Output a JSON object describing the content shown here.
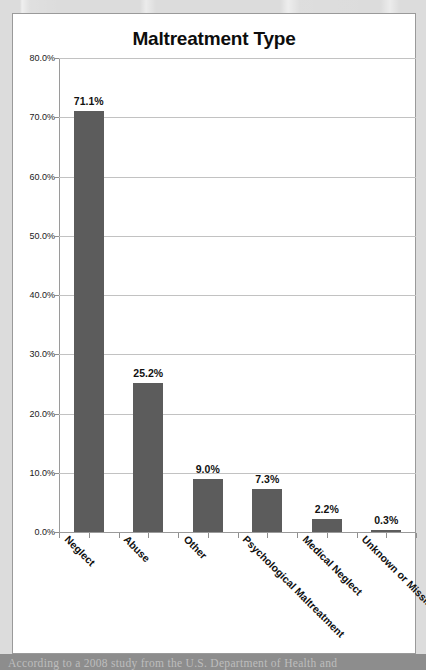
{
  "chart_data": {
    "type": "bar",
    "title": "Maltreatment Type",
    "xlabel": "",
    "ylabel": "",
    "categories": [
      "Neglect",
      "Abuse",
      "Other",
      "Psychological Maltreatment",
      "Medical Neglect",
      "Unknown or Missing"
    ],
    "values": [
      71.1,
      25.2,
      9.0,
      7.3,
      2.2,
      0.3
    ],
    "value_labels": [
      "71.1%",
      "25.2%",
      "9.0%",
      "7.3%",
      "2.2%",
      "0.3%"
    ],
    "ylim": [
      0,
      80
    ],
    "ytick_values": [
      0,
      10,
      20,
      30,
      40,
      50,
      60,
      70,
      80
    ],
    "ytick_labels": [
      "0.0%",
      "10.0%",
      "20.0%",
      "30.0%",
      "40.0%",
      "50.0%",
      "60.0%",
      "70.0%",
      "80.0%"
    ],
    "grid": true,
    "legend": false,
    "legend_position": "none",
    "bar_color": "#5c5c5c",
    "gridline_color": "#c2c2c2",
    "axis_color": "#9a9a9a",
    "panel_background": "#ffffff",
    "page_background": "#dcdcdc",
    "label_rotation_degrees": 45
  },
  "caption": {
    "text": "According to a 2008 study from the U.S. Department of Health and"
  }
}
